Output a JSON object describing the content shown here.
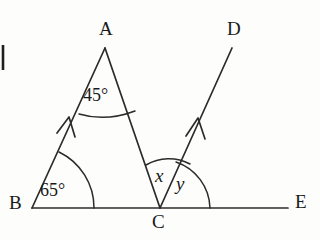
{
  "figure": {
    "kind": "geometry-diagram",
    "background_color": "#fdfdfc",
    "ink_color": "#2b2b2b"
  },
  "vertices": [
    {
      "id": "A",
      "label": "A",
      "x": 105,
      "y": 48
    },
    {
      "id": "B",
      "label": "B",
      "x": 32,
      "y": 208
    },
    {
      "id": "C",
      "label": "C",
      "x": 160,
      "y": 208
    },
    {
      "id": "D",
      "label": "D",
      "x": 232,
      "y": 48
    },
    {
      "id": "E",
      "label": "E",
      "x": 288,
      "y": 208
    }
  ],
  "segments": [
    {
      "name": "segment-BA",
      "from": "B",
      "to": "A",
      "arrow_marker": true
    },
    {
      "name": "segment-AC",
      "from": "A",
      "to": "C",
      "arrow_marker": false
    },
    {
      "name": "segment-BE",
      "from": "B",
      "to": "E",
      "arrow_marker": false
    },
    {
      "name": "ray-CD",
      "from": "C",
      "to": "D",
      "arrow_marker": true
    }
  ],
  "angles": [
    {
      "name": "angle-at-A",
      "vertex": "A",
      "label": "45°",
      "value": 45,
      "unit": "degrees"
    },
    {
      "name": "angle-at-B",
      "vertex": "B",
      "label": "65°",
      "value": 65,
      "unit": "degrees"
    },
    {
      "name": "angle-x",
      "vertex": "C",
      "label": "x",
      "value": null,
      "unit": "unknown"
    },
    {
      "name": "angle-y",
      "vertex": "C",
      "label": "y",
      "value": null,
      "unit": "unknown"
    }
  ],
  "margin_mark": {
    "name": "cropped-margin-glyph",
    "text": ""
  }
}
